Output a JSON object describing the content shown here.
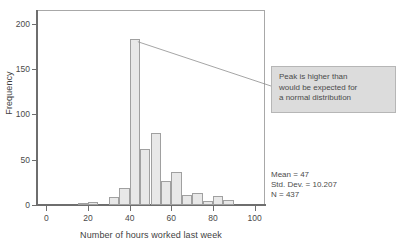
{
  "top_caption": "",
  "chart_data": {
    "type": "bar",
    "title": "",
    "subtitle": "",
    "xlabel": "Number of hours worked last week",
    "ylabel": "Frequency",
    "xlim": [
      -5,
      105
    ],
    "ylim": [
      0,
      215
    ],
    "grid": false,
    "legend": "none",
    "bin_width": 5,
    "categories": [
      "0",
      "5",
      "10",
      "15",
      "20",
      "25",
      "30",
      "35",
      "40",
      "45",
      "50",
      "55",
      "60",
      "65",
      "70",
      "75",
      "80",
      "85",
      "90",
      "95"
    ],
    "x": [
      2.5,
      7.5,
      12.5,
      17.5,
      22.5,
      27.5,
      32.5,
      37.5,
      42.5,
      47.5,
      52.5,
      57.5,
      62.5,
      67.5,
      72.5,
      77.5,
      82.5,
      87.5,
      92.5,
      97.5
    ],
    "values": [
      0,
      0,
      0,
      1,
      3,
      0,
      9,
      19,
      183,
      62,
      79,
      27,
      36,
      11,
      13,
      4,
      10,
      5,
      0,
      0
    ],
    "yticks": [
      0,
      50,
      100,
      150,
      200
    ],
    "ytick_labels": [
      "0",
      "50",
      "100",
      "150",
      "200"
    ],
    "xticks": [
      0,
      20,
      40,
      60,
      80,
      100
    ],
    "xtick_labels": [
      "0",
      "20",
      "40",
      "60",
      "80",
      "100"
    ],
    "bar_fill": "#e8e8e8",
    "bar_edge": "#a0a0a0",
    "annotations": [
      {
        "text_lines": [
          "Peak is higher than",
          "would be expected for",
          "a normal distribution"
        ],
        "points_to_x": 42.5,
        "points_to_y": 180
      }
    ],
    "stats": {
      "mean": "Mean = 47",
      "std_dev": "Std. Dev. = 10.207",
      "n": "N = 437"
    }
  }
}
